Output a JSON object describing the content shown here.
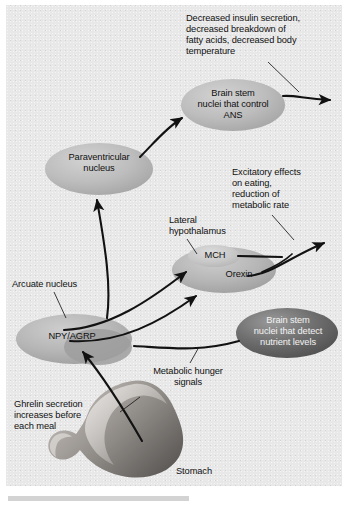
{
  "figure": {
    "background_color": "#e8e8e8",
    "page_color": "#ffffff"
  },
  "nodes": [
    {
      "id": "brain_stem_ans",
      "label": "Brain stem\nnuclei that control\nANS",
      "shape": "ellipse",
      "fill": "#b4b4b4",
      "text_color": "#111111"
    },
    {
      "id": "paraventricular_nucleus",
      "label": "Paraventricular\nnucleus",
      "shape": "ellipse",
      "fill": "#bdbdbd",
      "text_color": "#111111"
    },
    {
      "id": "lateral_hypothalamus",
      "label": "",
      "shape": "ellipse",
      "fill": "#b9b9b9",
      "text_color": "#111111"
    },
    {
      "id": "mch",
      "label": "MCH",
      "shape": "ellipse",
      "fill": "#cfcfcf",
      "text_color": "#111111"
    },
    {
      "id": "orexin",
      "label": "Orexin",
      "shape": "text",
      "fill": "none",
      "text_color": "#111111"
    },
    {
      "id": "arcuate_nucleus",
      "label": "NPY/AGRP",
      "shape": "ellipse",
      "fill": "#b0b0b0",
      "text_color": "#111111"
    },
    {
      "id": "brain_stem_nutrient",
      "label": "Brain stem\nnuclei that detect\nnutrient levels",
      "shape": "ellipse",
      "fill": "#6e6e6e",
      "text_color": "#f2f2f2"
    },
    {
      "id": "stomach",
      "label": "Stomach",
      "shape": "organ-illustration",
      "fill": "#8f8f8f",
      "text_color": "#111111"
    }
  ],
  "annotations": {
    "decreased_effects": "Decreased insulin secretion,\ndecreased breakdown of\nfatty acids, decreased body\ntemperature",
    "excitatory_effects": "Excitatory effects\non eating,\nreduction of\nmetabolic rate",
    "lateral_hypothalamus": "Lateral\nhypothalamus",
    "arcuate_nucleus": "Arcuate nucleus",
    "metabolic_hunger_signals": "Metabolic hunger\nsignals",
    "ghrelin_secretion": "Ghrelin secretion\nincreases before\neach meal",
    "stomach": "Stomach"
  },
  "oval_labels": {
    "brain_stem_ans": "Brain stem\nnuclei that control\nANS",
    "paraventricular_nucleus": "Paraventricular\nnucleus",
    "mch": "MCH",
    "orexin": "Orexin",
    "npy_agrp": "NPY/AGRP",
    "brain_stem_nutrient": "Brain stem\nnuclei that detect\nnutrient levels"
  },
  "edges": [
    {
      "from": "paraventricular_nucleus",
      "to": "brain_stem_ans",
      "type": "arrow"
    },
    {
      "from": "brain_stem_ans",
      "to": "decreased_effects_output",
      "type": "arrow"
    },
    {
      "from": "arcuate_nucleus",
      "to": "paraventricular_nucleus",
      "type": "arrow"
    },
    {
      "from": "arcuate_nucleus",
      "to": "mch",
      "type": "arrow"
    },
    {
      "from": "arcuate_nucleus",
      "to": "orexin",
      "type": "arrow"
    },
    {
      "from": "mch",
      "to": "excitatory_effects_output",
      "type": "arrow"
    },
    {
      "from": "orexin",
      "to": "excitatory_effects_output",
      "type": "arrow"
    },
    {
      "from": "brain_stem_nutrient",
      "to": "arcuate_nucleus",
      "type": "arrow"
    },
    {
      "from": "stomach",
      "to": "arcuate_nucleus",
      "type": "arrow"
    }
  ],
  "leader_lines": [
    {
      "label": "decreased_effects",
      "target": "brain_stem_ans"
    },
    {
      "label": "excitatory_effects",
      "target": "mch_orexin_output"
    },
    {
      "label": "lateral_hypothalamus",
      "target": "lateral_hypothalamus"
    },
    {
      "label": "arcuate_nucleus",
      "target": "arcuate_nucleus"
    },
    {
      "label": "metabolic_hunger_signals",
      "target": "nutrient_pathway"
    },
    {
      "label": "ghrelin_secretion",
      "target": "ghrelin_pathway"
    }
  ]
}
